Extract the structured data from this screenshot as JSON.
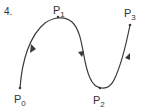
{
  "figure": {
    "number_label": "4.",
    "colors": {
      "stroke": "#3a3a3a",
      "text": "#333333",
      "background": "#ffffff"
    },
    "points": [
      {
        "name": "P",
        "sub": "0",
        "x": 20,
        "y": 88,
        "label_x": 15,
        "label_y": 103
      },
      {
        "name": "P",
        "sub": "1",
        "x": 58,
        "y": 18,
        "label_x": 54,
        "label_y": 14
      },
      {
        "name": "P",
        "sub": "2",
        "x": 99,
        "y": 88,
        "label_x": 94,
        "label_y": 104
      },
      {
        "name": "P",
        "sub": "3",
        "x": 130,
        "y": 25,
        "label_x": 125,
        "label_y": 16
      }
    ],
    "curve_description": "Smooth curve from P0 rising to P1, descending to P2, rising to P3 with direction arrows on each segment"
  }
}
